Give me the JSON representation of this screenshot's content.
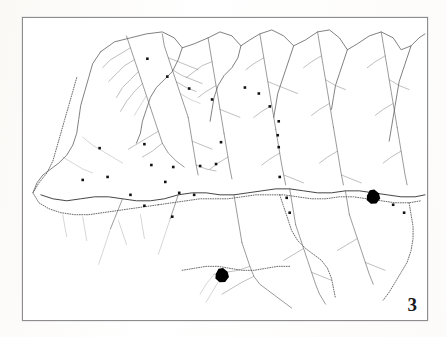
{
  "figure": {
    "number": "3",
    "kind": "distribution-map",
    "caption_visible": false
  },
  "page": {
    "background_color": "#fefefe",
    "frame_color": "#8d8d90",
    "ink_color": "#1b1b1b",
    "line_color": "#4a4a4a",
    "boundary_color": "#6b6b6b"
  },
  "map": {
    "title_visible": false,
    "legend_visible": false,
    "scale_bar_visible": false,
    "north_arrow_visible": false,
    "frame": {
      "x": 22,
      "y": 17,
      "width": 406,
      "height": 304
    },
    "labels": [
      {
        "text": "",
        "x": 338,
        "y": 173,
        "note": "illegible place name left of large settlement blob"
      },
      {
        "text": "",
        "x": 222,
        "y": 257,
        "note": "illegible place name right of lower settlement blob"
      },
      {
        "text": "",
        "x": 207,
        "y": 266,
        "note": "illegible place name lower left"
      },
      {
        "text": "",
        "x": 264,
        "y": 259,
        "note": "illegible place name lower right"
      }
    ]
  },
  "chart_data": {
    "type": "scatter",
    "title": "",
    "xlabel": "",
    "ylabel": "",
    "xlim": [
      0,
      406
    ],
    "ylim": [
      0,
      304
    ],
    "grid": false,
    "legend_position": "none",
    "series": [
      {
        "name": "sites",
        "marker": "filled-square",
        "size": 2.6,
        "color": "#111111",
        "points": [
          [
            125,
            41
          ],
          [
            145,
            59
          ],
          [
            167,
            71
          ],
          [
            190,
            82
          ],
          [
            199,
            125
          ],
          [
            223,
            70
          ],
          [
            237,
            76
          ],
          [
            248,
            89
          ],
          [
            257,
            104
          ],
          [
            256,
            118
          ],
          [
            257,
            130
          ],
          [
            77,
            131
          ],
          [
            122,
            127
          ],
          [
            60,
            163
          ],
          [
            85,
            160
          ],
          [
            129,
            148
          ],
          [
            151,
            150
          ],
          [
            178,
            149
          ],
          [
            194,
            147
          ],
          [
            143,
            165
          ],
          [
            157,
            176
          ],
          [
            172,
            178
          ],
          [
            108,
            178
          ],
          [
            122,
            189
          ],
          [
            150,
            200
          ],
          [
            258,
            160
          ],
          [
            265,
            181
          ],
          [
            268,
            196
          ],
          [
            372,
            188
          ],
          [
            383,
            196
          ]
        ]
      },
      {
        "name": "major-settlements",
        "marker": "filled-blob",
        "size": 7,
        "color": "#000000",
        "points": [
          [
            352,
            180
          ],
          [
            200,
            259
          ]
        ]
      }
    ]
  }
}
